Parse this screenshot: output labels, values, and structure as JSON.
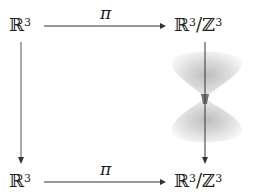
{
  "diagram": {
    "type": "commutative-diagram",
    "nodes": {
      "top_left": {
        "base": "ℝ",
        "exp": "3"
      },
      "top_right": {
        "base": "ℝ",
        "exp": "3",
        "sep": "/",
        "base2": "ℤ",
        "exp2": "3"
      },
      "bottom_left": {
        "base": "ℝ",
        "exp": "3"
      },
      "bottom_right": {
        "base": "ℝ",
        "exp": "3",
        "sep": "/",
        "base2": "ℤ",
        "exp2": "3"
      }
    },
    "arrows": {
      "top": {
        "label": "π"
      },
      "bottom": {
        "label": "π"
      },
      "left": {
        "label": ""
      },
      "right": {
        "label": ""
      }
    },
    "illustration": "hourglass-surface"
  }
}
